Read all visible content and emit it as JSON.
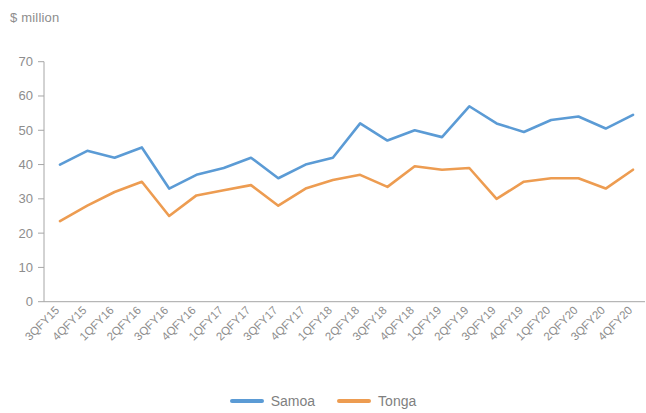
{
  "axis_title": "$ million",
  "legend": {
    "items": [
      {
        "label": "Samoa",
        "color": "#5b9bd5",
        "name": "legend-item-samoa"
      },
      {
        "label": "Tonga",
        "color": "#ed9c51",
        "name": "legend-item-tonga"
      }
    ]
  },
  "chart_data": {
    "type": "line",
    "title": "",
    "subtitle": "",
    "xlabel": "",
    "ylabel": "$ million",
    "ylim": [
      0,
      70
    ],
    "yticks": [
      0,
      10,
      20,
      30,
      40,
      50,
      60,
      70
    ],
    "ytick_labels": [
      "0",
      "10",
      "20",
      "30",
      "40",
      "50",
      "60",
      "70"
    ],
    "grid": false,
    "legend_position": "bottom",
    "categories": [
      "3QFY15",
      "4QFY15",
      "1QFY16",
      "2QFY16",
      "3QFY16",
      "4QFY16",
      "1QFY17",
      "2QFY17",
      "3QFY17",
      "4QFY17",
      "1QFY18",
      "2QFY18",
      "3QFY18",
      "4QFY18",
      "1QFY19",
      "2QFY19",
      "3QFY19",
      "4QFY19",
      "1QFY20",
      "2QFY20",
      "3QFY20",
      "4QFY20"
    ],
    "series": [
      {
        "name": "Samoa",
        "color": "#5b9bd5",
        "values": [
          40,
          44,
          42,
          45,
          33,
          37,
          39,
          42,
          36,
          40,
          42,
          52,
          47,
          50,
          48,
          57,
          52,
          49.5,
          53,
          54,
          50.5,
          54.5
        ]
      },
      {
        "name": "Tonga",
        "color": "#ed9c51",
        "values": [
          23.5,
          28,
          32,
          35,
          25,
          31,
          32.5,
          34,
          28,
          33,
          35.5,
          37,
          33.5,
          39.5,
          38.5,
          39,
          30,
          35,
          36,
          36,
          33,
          38.5
        ]
      }
    ]
  }
}
